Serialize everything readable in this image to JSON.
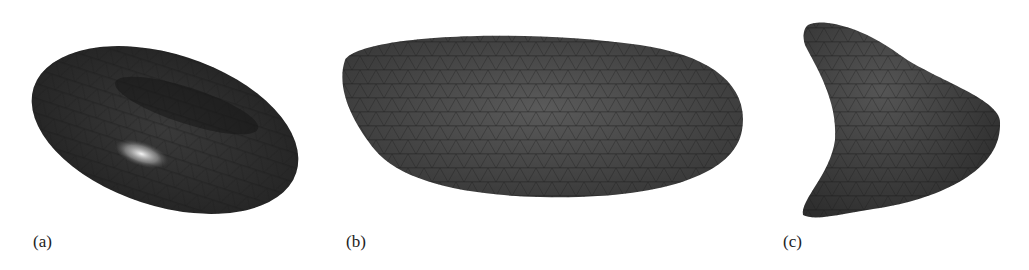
{
  "figure": {
    "panels": [
      {
        "label": "(a)",
        "shape": "biconcave-disc mesh (red blood cell)"
      },
      {
        "label": "(b)",
        "shape": "elongated ellipsoid mesh"
      },
      {
        "label": "(c)",
        "shape": "parachute/slipper-shaped mesh"
      }
    ],
    "colors": {
      "mesh_dark": "#2b2b2b",
      "mesh_mid": "#4a4a4a",
      "highlight": "#f0f0f0",
      "background": "#ffffff"
    }
  }
}
